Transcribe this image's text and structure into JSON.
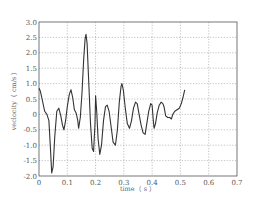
{
  "chart_data": {
    "type": "line",
    "title": "",
    "xlabel": "time（ s ）",
    "ylabel": "veclocity（ cm/s ）",
    "xlim": [
      0,
      0.7
    ],
    "ylim": [
      -2.0,
      3.0
    ],
    "x_ticks": [
      "0",
      "0.1",
      "0.2",
      "0.3",
      "0.4",
      "0.5",
      "0.6",
      "0.7"
    ],
    "y_ticks": [
      "3.0",
      "2.5",
      "2.0",
      "1.5",
      "1.0",
      "0.5",
      "0",
      "-0.5",
      "-1.0",
      "-1.5",
      "-2.0"
    ],
    "grid": true,
    "legend": null,
    "series": [
      {
        "name": "velocity",
        "color": "#333333",
        "x": [
          0.0,
          0.005,
          0.012,
          0.02,
          0.028,
          0.035,
          0.041,
          0.045,
          0.05,
          0.056,
          0.063,
          0.07,
          0.077,
          0.083,
          0.088,
          0.094,
          0.1,
          0.107,
          0.113,
          0.119,
          0.125,
          0.131,
          0.137,
          0.14,
          0.146,
          0.152,
          0.158,
          0.163,
          0.166,
          0.17,
          0.176,
          0.182,
          0.188,
          0.193,
          0.198,
          0.2,
          0.204,
          0.209,
          0.215,
          0.221,
          0.228,
          0.235,
          0.241,
          0.248,
          0.255,
          0.262,
          0.27,
          0.277,
          0.284,
          0.29,
          0.293,
          0.298,
          0.305,
          0.312,
          0.32,
          0.327,
          0.334,
          0.341,
          0.347,
          0.354,
          0.361,
          0.368,
          0.375,
          0.381,
          0.388,
          0.395,
          0.4,
          0.404,
          0.407,
          0.412,
          0.418,
          0.425,
          0.432,
          0.438,
          0.442,
          0.448,
          0.455,
          0.462,
          0.468,
          0.473,
          0.48,
          0.488,
          0.496,
          0.503,
          0.509,
          0.515
        ],
        "y": [
          0.85,
          0.75,
          0.45,
          0.1,
          0.0,
          -0.2,
          -1.2,
          -1.9,
          -1.7,
          -0.7,
          0.1,
          0.2,
          -0.05,
          -0.35,
          -0.5,
          -0.2,
          0.25,
          0.65,
          0.8,
          0.55,
          0.15,
          0.05,
          -0.2,
          -0.45,
          -0.1,
          0.7,
          1.8,
          2.45,
          2.6,
          2.3,
          1.0,
          -0.3,
          -1.1,
          -1.2,
          -0.3,
          0.6,
          0.1,
          -0.8,
          -1.3,
          -1.0,
          -0.2,
          0.25,
          0.3,
          0.1,
          -0.4,
          -0.9,
          -1.0,
          -0.5,
          0.4,
          0.9,
          1.0,
          0.8,
          0.2,
          -0.3,
          -0.45,
          -0.2,
          0.2,
          0.4,
          0.35,
          0.0,
          -0.35,
          -0.6,
          -0.65,
          -0.3,
          0.1,
          0.35,
          0.3,
          -0.2,
          -0.45,
          -0.3,
          0.05,
          0.3,
          0.4,
          0.35,
          0.25,
          -0.05,
          -0.1,
          -0.1,
          -0.15,
          0.0,
          0.1,
          0.15,
          0.2,
          0.35,
          0.55,
          0.8
        ]
      }
    ]
  }
}
